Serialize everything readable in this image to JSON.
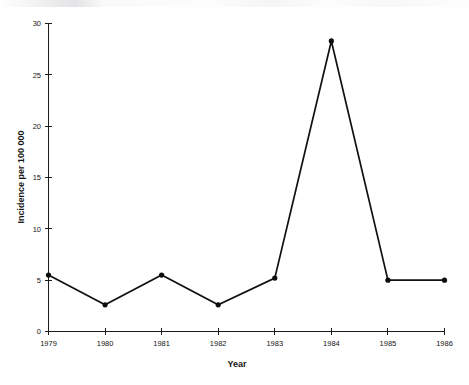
{
  "chart_data": {
    "type": "line",
    "title": "",
    "xlabel": "Year",
    "ylabel": "Incidence per 100 000",
    "categories": [
      "1979",
      "1980",
      "1981",
      "1982",
      "1983",
      "1984",
      "1985",
      "1986"
    ],
    "x": [
      1979,
      1980,
      1981,
      1982,
      1983,
      1984,
      1985,
      1986
    ],
    "values": [
      5.5,
      2.6,
      5.5,
      2.6,
      5.2,
      28.3,
      5.0,
      5.0
    ],
    "series": [
      {
        "name": "Incidence per 100 000",
        "values": [
          5.5,
          2.6,
          5.5,
          2.6,
          5.2,
          28.3,
          5.0,
          5.0
        ]
      }
    ],
    "xlim": [
      1979,
      1986
    ],
    "ylim": [
      0,
      30
    ],
    "yticks": [
      0,
      5,
      10,
      15,
      20,
      25,
      30
    ],
    "ytick_labels": [
      "0",
      "5",
      "10",
      "15",
      "20",
      "25",
      "30"
    ],
    "xticks": [
      1979,
      1980,
      1981,
      1982,
      1983,
      1984,
      1985,
      1986
    ],
    "xtick_labels": [
      "1979",
      "1980",
      "1981",
      "1982",
      "1983",
      "1984",
      "1985",
      "1986"
    ],
    "grid": false,
    "legend": false,
    "marker": "filled-circle",
    "line_color": "#111111",
    "marker_color": "#0d0d0d",
    "background_color": "#ffffff"
  }
}
